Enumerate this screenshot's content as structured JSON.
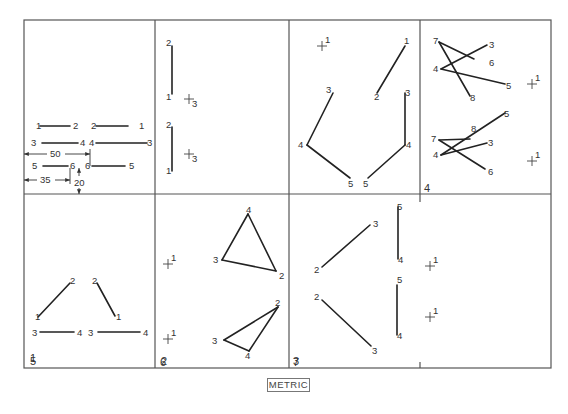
{
  "figure": {
    "caption": "METRIC",
    "frame": {
      "x1": 24,
      "y1": 20,
      "x2": 551,
      "y2": 368
    },
    "row_divider_y": 194,
    "col_dividers_top": [
      155,
      289,
      420
    ],
    "col_dividers_bottom": [
      155,
      289
    ],
    "bottom_ticks_x": 420
  },
  "panels": [
    {
      "id": 1,
      "number": "1",
      "num_pos": [
        30,
        362
      ],
      "segments": [
        [
          40,
          126,
          70,
          126
        ],
        [
          96,
          126,
          128,
          126
        ],
        [
          42,
          143,
          78,
          143
        ],
        [
          96,
          143,
          147,
          143
        ],
        [
          43,
          166,
          68,
          166
        ],
        [
          92,
          166,
          125,
          166
        ]
      ],
      "labels": [
        {
          "t": "1",
          "x": 36,
          "y": 129
        },
        {
          "t": "2",
          "x": 73,
          "y": 129
        },
        {
          "t": "2",
          "x": 91,
          "y": 129
        },
        {
          "t": "1",
          "x": 139,
          "y": 129
        },
        {
          "t": "3",
          "x": 31,
          "y": 146
        },
        {
          "t": "4",
          "x": 80,
          "y": 146
        },
        {
          "t": "4",
          "x": 89,
          "y": 146
        },
        {
          "t": "3",
          "x": 147,
          "y": 146
        },
        {
          "t": "5",
          "x": 32,
          "y": 169
        },
        {
          "t": "6",
          "x": 70,
          "y": 169
        },
        {
          "t": "6",
          "x": 85,
          "y": 169
        },
        {
          "t": "5",
          "x": 129,
          "y": 169
        }
      ],
      "dimensions": [
        {
          "label": "50",
          "x1": 24,
          "x2": 90,
          "y": 154,
          "text_x": 50,
          "text_y": 157
        },
        {
          "label": "35",
          "x1": 24,
          "x2": 70,
          "y": 180,
          "text_x": 40,
          "text_y": 183
        },
        {
          "label": "20",
          "x": 79,
          "y1": 168,
          "y2": 194,
          "text_x": 74,
          "text_y": 186
        }
      ],
      "ext_lines": [
        [
          90,
          149,
          90,
          166
        ],
        [
          70,
          168,
          70,
          184
        ]
      ]
    },
    {
      "id": 2,
      "number": "2",
      "num_pos": [
        161,
        365
      ],
      "segments": [
        [
          172,
          46,
          172,
          94
        ],
        [
          172,
          127,
          172,
          171
        ]
      ],
      "labels": [
        {
          "t": "2",
          "x": 166,
          "y": 46
        },
        {
          "t": "1",
          "x": 166,
          "y": 100
        },
        {
          "t": "2",
          "x": 166,
          "y": 128
        },
        {
          "t": "1",
          "x": 166,
          "y": 174
        }
      ],
      "crosses": [
        {
          "x": 189,
          "y": 99,
          "sub": "3"
        },
        {
          "x": 189,
          "y": 154,
          "sub": "3"
        }
      ]
    },
    {
      "id": 3,
      "number": "3",
      "num_pos": [
        293,
        365
      ],
      "segments": [
        [
          405,
          46,
          377,
          93
        ],
        [
          333,
          93,
          307,
          145
        ],
        [
          307,
          145,
          350,
          178
        ],
        [
          405,
          93,
          405,
          145
        ],
        [
          405,
          145,
          368,
          178
        ]
      ],
      "labels": [
        {
          "t": "1",
          "x": 404,
          "y": 44
        },
        {
          "t": "2",
          "x": 374,
          "y": 100
        },
        {
          "t": "3",
          "x": 326,
          "y": 93
        },
        {
          "t": "3",
          "x": 405,
          "y": 96
        },
        {
          "t": "4",
          "x": 298,
          "y": 148
        },
        {
          "t": "4",
          "x": 406,
          "y": 148
        },
        {
          "t": "5",
          "x": 348,
          "y": 187
        },
        {
          "t": "5",
          "x": 363,
          "y": 187
        }
      ],
      "crosses": [
        {
          "x": 322,
          "y": 46,
          "sup": "1"
        }
      ]
    },
    {
      "id": 4,
      "number": "4",
      "num_pos": [
        424,
        192
      ],
      "segments": [
        [
          439,
          42,
          474,
          59
        ],
        [
          439,
          42,
          470,
          96
        ],
        [
          441,
          69,
          487,
          45
        ],
        [
          441,
          69,
          505,
          84
        ],
        [
          439,
          140,
          470,
          139
        ],
        [
          439,
          140,
          485,
          169
        ],
        [
          441,
          155,
          505,
          113
        ],
        [
          441,
          155,
          487,
          143
        ]
      ],
      "labels": [
        {
          "t": "7",
          "x": 433,
          "y": 44
        },
        {
          "t": "3",
          "x": 489,
          "y": 48
        },
        {
          "t": "6",
          "x": 489,
          "y": 66
        },
        {
          "t": "4",
          "x": 433,
          "y": 72
        },
        {
          "t": "5",
          "x": 506,
          "y": 89
        },
        {
          "t": "8",
          "x": 470,
          "y": 101
        },
        {
          "t": "5",
          "x": 504,
          "y": 117
        },
        {
          "t": "8",
          "x": 471,
          "y": 132
        },
        {
          "t": "7",
          "x": 431,
          "y": 142
        },
        {
          "t": "3",
          "x": 488,
          "y": 146
        },
        {
          "t": "4",
          "x": 433,
          "y": 158
        },
        {
          "t": "6",
          "x": 488,
          "y": 175
        }
      ],
      "crosses": [
        {
          "x": 532,
          "y": 84,
          "sup": "1"
        },
        {
          "x": 532,
          "y": 161,
          "sup": "1"
        }
      ]
    },
    {
      "id": 5,
      "number": "5",
      "num_pos": [
        30,
        365
      ],
      "segments": [
        [
          38,
          317,
          70,
          283
        ],
        [
          97,
          283,
          115,
          316
        ],
        [
          40,
          332,
          74,
          332
        ],
        [
          98,
          332,
          140,
          332
        ]
      ],
      "labels": [
        {
          "t": "2",
          "x": 70,
          "y": 284
        },
        {
          "t": "2",
          "x": 92,
          "y": 284
        },
        {
          "t": "1",
          "x": 35,
          "y": 320
        },
        {
          "t": "1",
          "x": 116,
          "y": 320
        },
        {
          "t": "3",
          "x": 32,
          "y": 336
        },
        {
          "t": "4",
          "x": 77,
          "y": 336
        },
        {
          "t": "3",
          "x": 88,
          "y": 336
        },
        {
          "t": "4",
          "x": 143,
          "y": 336
        }
      ],
      "crosses": []
    },
    {
      "id": 6,
      "number": "6",
      "num_pos": [
        160,
        366
      ],
      "segments": [
        [
          248,
          214,
          222,
          260
        ],
        [
          222,
          260,
          276,
          271
        ],
        [
          276,
          271,
          248,
          214
        ],
        [
          278,
          307,
          224,
          340
        ],
        [
          224,
          340,
          249,
          351
        ],
        [
          249,
          351,
          278,
          307
        ]
      ],
      "labels": [
        {
          "t": "4",
          "x": 246,
          "y": 213
        },
        {
          "t": "3",
          "x": 213,
          "y": 263
        },
        {
          "t": "2",
          "x": 279,
          "y": 279
        },
        {
          "t": "2",
          "x": 275,
          "y": 306
        },
        {
          "t": "3",
          "x": 212,
          "y": 344
        },
        {
          "t": "4",
          "x": 245,
          "y": 359
        }
      ],
      "crosses": [
        {
          "x": 168,
          "y": 264,
          "sup": "1"
        },
        {
          "x": 168,
          "y": 339,
          "sup": "1"
        }
      ]
    },
    {
      "id": 7,
      "number": "7",
      "num_pos": [
        293,
        366
      ],
      "segments": [
        [
          322,
          267,
          370,
          225
        ],
        [
          398,
          207,
          398,
          259
        ],
        [
          322,
          300,
          371,
          346
        ],
        [
          397,
          285,
          397,
          335
        ]
      ],
      "labels": [
        {
          "t": "3",
          "x": 373,
          "y": 227
        },
        {
          "t": "5",
          "x": 397,
          "y": 210
        },
        {
          "t": "2",
          "x": 314,
          "y": 273
        },
        {
          "t": "4",
          "x": 398,
          "y": 263
        },
        {
          "t": "5",
          "x": 397,
          "y": 283
        },
        {
          "t": "2",
          "x": 314,
          "y": 300
        },
        {
          "t": "4",
          "x": 397,
          "y": 339
        },
        {
          "t": "3",
          "x": 372,
          "y": 354
        }
      ],
      "crosses": [
        {
          "x": 430,
          "y": 266,
          "sup": "1"
        },
        {
          "x": 430,
          "y": 317,
          "sup": "1"
        }
      ]
    }
  ]
}
